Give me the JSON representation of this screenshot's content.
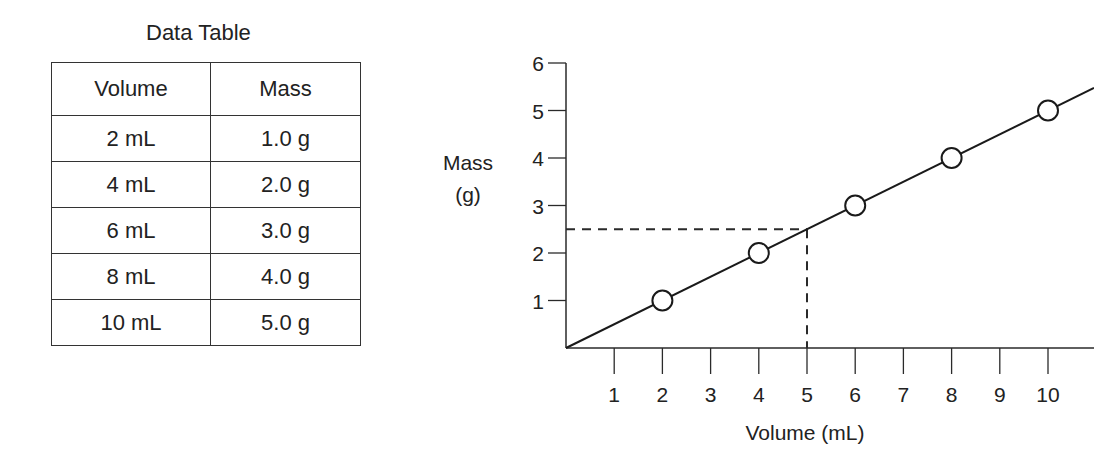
{
  "table": {
    "title": "Data Table",
    "headers": [
      "Volume",
      "Mass"
    ],
    "rows": [
      [
        "2 mL",
        "1.0 g"
      ],
      [
        "4 mL",
        "2.0 g"
      ],
      [
        "6 mL",
        "3.0 g"
      ],
      [
        "8 mL",
        "4.0 g"
      ],
      [
        "10 mL",
        "5.0 g"
      ]
    ]
  },
  "chart_data": {
    "type": "line",
    "title": "",
    "xlabel": "Volume (mL)",
    "ylabel": "Mass (g)",
    "ylabel_lines": [
      "Mass",
      "(g)"
    ],
    "x_ticks": [
      "1",
      "2",
      "3",
      "4",
      "5",
      "6",
      "7",
      "8",
      "9",
      "10"
    ],
    "y_ticks": [
      "1",
      "2",
      "3",
      "4",
      "5",
      "6"
    ],
    "xlim": [
      0,
      11
    ],
    "ylim": [
      0,
      6
    ],
    "grid": false,
    "series": [
      {
        "name": "Mass vs Volume",
        "marker": "open-circle",
        "x": [
          2,
          4,
          6,
          8,
          10
        ],
        "y": [
          1.0,
          2.0,
          3.0,
          4.0,
          5.0
        ]
      }
    ],
    "best_fit_line": {
      "slope": 0.5,
      "intercept": 0
    },
    "annotation": {
      "type": "dashed-guides",
      "x": 5,
      "y": 2.5
    }
  }
}
